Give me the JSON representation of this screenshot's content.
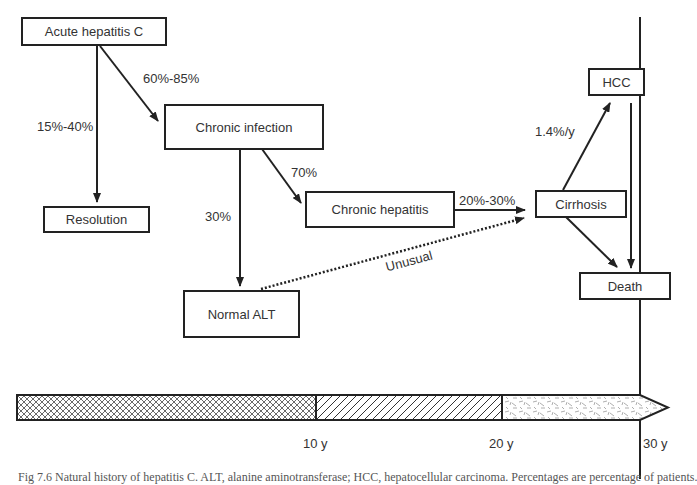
{
  "nodes": {
    "acute": "Acute hepatitis C",
    "chronic_infection": "Chronic infection",
    "resolution": "Resolution",
    "chronic_hepatitis": "Chronic hepatitis",
    "normal_alt": "Normal ALT",
    "cirrhosis": "Cirrhosis",
    "hcc": "HCC",
    "death": "Death"
  },
  "edges": {
    "acute_to_chronic": "60%-85%",
    "acute_to_resolution": "15%-40%",
    "chronic_to_hepatitis": "70%",
    "chronic_to_normal": "30%",
    "hepatitis_to_cirrhosis": "20%-30%",
    "normal_to_cirrhosis": "Unusual",
    "cirrhosis_to_hcc": "1.4%/y"
  },
  "timeline": {
    "ticks": [
      "10 y",
      "20 y",
      "30 y"
    ]
  },
  "caption": "Fig 7.6  Natural history of hepatitis C. ALT, alanine aminotransferase; HCC, hepatocellular carcinoma. Percentages are percentage of patients."
}
